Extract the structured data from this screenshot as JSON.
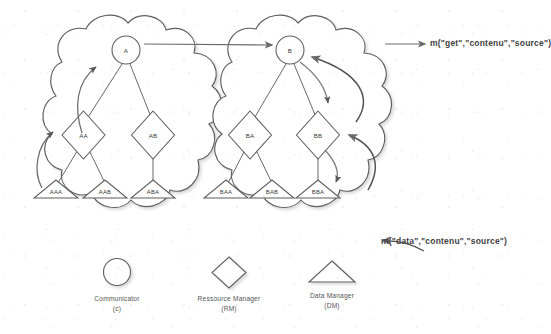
{
  "diagram": {
    "type": "node-link-diagram",
    "style": "scanned-grayscale-line-drawing",
    "line_color": "#555555",
    "text_color": "#4a4a4a",
    "background": "#ffffff"
  },
  "clouds": [
    {
      "id": "cloud-a",
      "name": "domain-a"
    },
    {
      "id": "cloud-b",
      "name": "domain-b"
    }
  ],
  "nodes": {
    "communicators": [
      {
        "id": "A",
        "label": "A",
        "cloud": "cloud-a",
        "shape": "circle"
      },
      {
        "id": "B",
        "label": "B",
        "cloud": "cloud-b",
        "shape": "circle"
      }
    ],
    "resource_managers": [
      {
        "id": "AA",
        "label": "AA",
        "cloud": "cloud-a",
        "shape": "diamond"
      },
      {
        "id": "AB",
        "label": "AB",
        "cloud": "cloud-a",
        "shape": "diamond"
      },
      {
        "id": "BA",
        "label": "BA",
        "cloud": "cloud-b",
        "shape": "diamond"
      },
      {
        "id": "BB",
        "label": "BB",
        "cloud": "cloud-b",
        "shape": "diamond"
      }
    ],
    "data_managers": [
      {
        "id": "AAA",
        "label": "AAA",
        "cloud": "cloud-a",
        "shape": "triangle"
      },
      {
        "id": "AAB",
        "label": "AAB",
        "cloud": "cloud-a",
        "shape": "triangle"
      },
      {
        "id": "ABA",
        "label": "ABA",
        "cloud": "cloud-a",
        "shape": "triangle"
      },
      {
        "id": "BAA",
        "label": "BAA",
        "cloud": "cloud-b",
        "shape": "triangle"
      },
      {
        "id": "BAB",
        "label": "BAB",
        "cloud": "cloud-b",
        "shape": "triangle"
      },
      {
        "id": "BBA",
        "label": "BBA",
        "cloud": "cloud-b",
        "shape": "triangle"
      }
    ]
  },
  "tree_edges": [
    {
      "from": "A",
      "to": "AA"
    },
    {
      "from": "A",
      "to": "AB"
    },
    {
      "from": "AA",
      "to": "AAA"
    },
    {
      "from": "AA",
      "to": "AAB"
    },
    {
      "from": "AB",
      "to": "ABA"
    },
    {
      "from": "B",
      "to": "BA"
    },
    {
      "from": "B",
      "to": "BB"
    },
    {
      "from": "BA",
      "to": "BAA"
    },
    {
      "from": "BA",
      "to": "BAB"
    },
    {
      "from": "BB",
      "to": "BBA"
    }
  ],
  "message_arrows": [
    {
      "id": "arrow-aaa-to-aa",
      "kind": "curved-up",
      "note": "AAA up to AA"
    },
    {
      "id": "arrow-aa-to-a",
      "kind": "curved-up",
      "note": "AA up to A"
    },
    {
      "id": "arrow-a-to-b",
      "kind": "straight-right",
      "note": "A across to B"
    },
    {
      "id": "arrow-b-to-bb",
      "kind": "curved-down",
      "note": "B down to BB"
    },
    {
      "id": "arrow-bb-to-bba",
      "kind": "curved-down",
      "note": "BB down to BBA"
    },
    {
      "id": "arrow-bba-to-bb",
      "kind": "curved-up",
      "note": "BBA up to BB"
    },
    {
      "id": "arrow-bb-to-b",
      "kind": "curved-up",
      "note": "BB up to B"
    }
  ],
  "annotations": {
    "top_right": {
      "text": "m(\"get\",\"contenu\",\"source\")",
      "arrow": "straight-right"
    },
    "bottom_right": {
      "text": "m(\"data\",\"contenu\",\"source\")",
      "arrow": "curved-left"
    }
  },
  "legend": {
    "items": [
      {
        "shape": "circle",
        "icon": "circle-icon",
        "label": "Communicator",
        "abbr": "(c)"
      },
      {
        "shape": "diamond",
        "icon": "diamond-icon",
        "label": "Ressource Manager",
        "abbr": "(RM)"
      },
      {
        "shape": "triangle",
        "icon": "triangle-icon",
        "label": "Data Manager",
        "abbr": "(DM)"
      }
    ]
  }
}
